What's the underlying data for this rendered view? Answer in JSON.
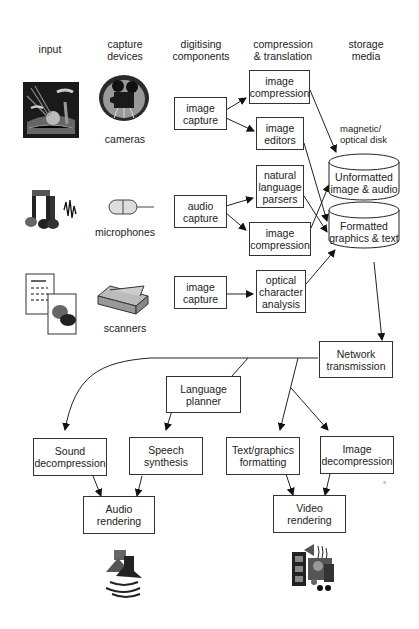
{
  "headers": {
    "input": "input",
    "capture_devices": "capture\ndevices",
    "digitising_components": "digitising\ncomponents",
    "compression_translation": "compression\n& translation",
    "storage_media": "storage\nmedia"
  },
  "devices": {
    "cameras": "cameras",
    "microphones": "microphones",
    "scanners": "scanners"
  },
  "digitising": {
    "image_capture_1": "image\ncapture",
    "audio_capture": "audio\ncapture",
    "image_capture_2": "image\ncapture"
  },
  "compression": {
    "image_compression_1": "image\ncompression",
    "image_editors": "image\neditors",
    "natural_language_parsers": "natural\nlanguage\nparsers",
    "image_compression_2": "image\ncompression",
    "optical_character_analysis": "optical\ncharacter\nanalysis"
  },
  "storage": {
    "disk_label": "magnetic/\noptical disk",
    "unformatted": "Unformatted\nimage & audio",
    "formatted": "Formatted\ngraphics & text"
  },
  "output": {
    "network_transmission": "Network\ntransmission",
    "language_planner": "Language\nplanner",
    "sound_decompression": "Sound\ndecompression",
    "speech_synthesis": "Speech\nsynthesis",
    "text_graphics_formatting": "Text/graphics\nformatting",
    "image_decompression": "Image\ndecompression",
    "audio_rendering": "Audio\nrendering",
    "video_rendering": "Video\nrendering"
  },
  "icons": {
    "landscape": "landscape-picture-icon",
    "camera": "film-camera-icon",
    "music": "music-notes-icon",
    "microphone": "microphone-icon",
    "document": "document-picture-icon",
    "scanner": "flatbed-scanner-icon",
    "speaker": "speaker-sound-icon",
    "multimedia": "multimedia-video-icon"
  },
  "stray_mark": "°"
}
